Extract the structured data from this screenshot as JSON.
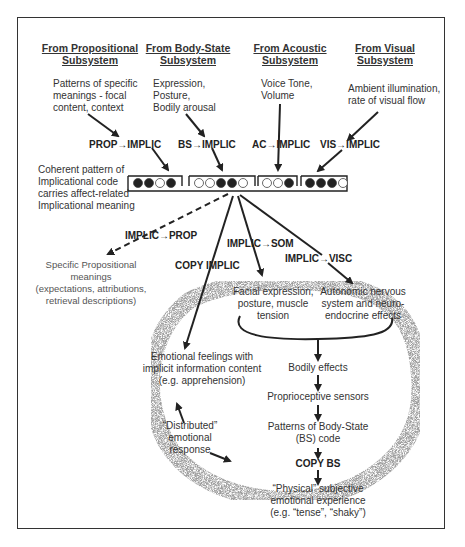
{
  "subsystems": [
    {
      "header_line1": "From Propositional",
      "header_line2": "Subsystem",
      "inputs": [
        "Patterns of specific",
        "meanings - focal",
        "content,  context"
      ],
      "transform": "PROP→IMPLIC",
      "code": [
        1,
        1,
        0,
        1
      ]
    },
    {
      "header_line1": "From Body-State",
      "header_line2": "Subsystem",
      "inputs": [
        "Expression,",
        "Posture,",
        "Bodily arousal"
      ],
      "transform": "BS→IMPLIC",
      "code": [
        0,
        0,
        1,
        1,
        0
      ]
    },
    {
      "header_line1": "From Acoustic",
      "header_line2": "Subsystem",
      "inputs": [
        "Voice Tone,",
        "Volume"
      ],
      "transform": "AC→IMPLIC",
      "code": [
        0,
        0,
        1
      ]
    },
    {
      "header_line1": "From Visual",
      "header_line2": "Subsystem",
      "inputs": [
        "Ambient illumination,",
        "rate of visual flow"
      ],
      "transform": "VIS→IMPLIC",
      "code": [
        1,
        1,
        1,
        0
      ]
    }
  ],
  "implicational_note": [
    "Coherent pattern of",
    "Implicational code",
    "carries affect-related",
    "Implicational meaning"
  ],
  "outputs": {
    "implic_prop": "IMPLIC→PROP",
    "prop_meanings": [
      "Specific Propositional",
      "meanings",
      "(expectations, attributions,",
      "retrieval descriptions)"
    ],
    "copy_implic": "COPY IMPLIC",
    "implic_som": "IMPLIC→SOM",
    "implic_visc": "IMPLIC→VISC",
    "som_effects": [
      "Facial expression,",
      "posture, muscle",
      "tension"
    ],
    "visc_effects": [
      "Autonomic nervous",
      "system and neuro-",
      "endocrine effects"
    ],
    "emotional_feelings": [
      "Emotional feelings with",
      "implicit information content",
      "(e.g. apprehension)"
    ],
    "bodily_effects": "Bodily effects",
    "proprioceptive": "Proprioceptive sensors",
    "bs_patterns": [
      "Patterns of Body-State",
      "(BS) code"
    ],
    "copy_bs": "COPY BS",
    "physical_experience": [
      "“Physical” subjective",
      "emotional experience",
      "(e.g. “tense”, “shaky”)"
    ],
    "distributed": [
      "“Distributed”",
      "emotional",
      "response"
    ]
  },
  "colors": {
    "ink": "#222222",
    "frame": "#333333",
    "stipple": "#9a9a9a"
  }
}
